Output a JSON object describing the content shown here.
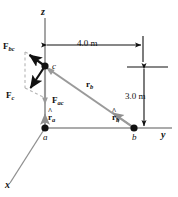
{
  "figure": {
    "type": "physics-free-body-vector-diagram",
    "background_color": "#ffffff",
    "ink_color": "#111111",
    "gray_color": "#9a9a9a",
    "dashed_color": "#b5b5b5"
  },
  "axes": {
    "z_label": "z",
    "y_label": "y",
    "x_label": "x"
  },
  "points": {
    "a_label": "a",
    "b_label": "b",
    "c_label": "c"
  },
  "vectors": {
    "f_bc": {
      "base": "F",
      "sub": "bc"
    },
    "f_c": {
      "base": "F",
      "sub": "c"
    },
    "f_ac": {
      "base": "F",
      "sub": "ac"
    },
    "r_b": {
      "base": "r",
      "sub": "b"
    },
    "r_hat_a": {
      "hat": "^",
      "base": "r",
      "sub": "a"
    },
    "r_hat_b": {
      "hat": "^",
      "base": "r",
      "sub": "b"
    }
  },
  "dimensions": {
    "horizontal": "4.0 m",
    "vertical": "3.0 m"
  }
}
